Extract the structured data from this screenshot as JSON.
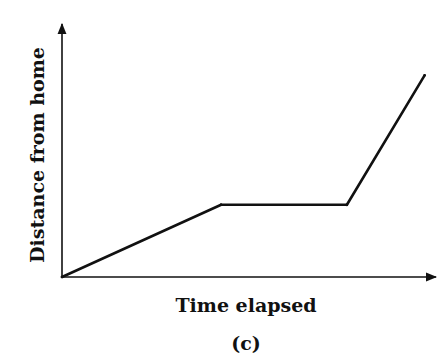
{
  "chart_data": {
    "type": "line",
    "title": "",
    "xlabel": "Time elapsed",
    "ylabel": "Distance from home",
    "caption": "(c)",
    "xlim": [
      0,
      1
    ],
    "ylim": [
      0,
      1
    ],
    "grid": false,
    "ticks": false,
    "series": [
      {
        "name": "distance",
        "x": [
          0,
          0.43,
          0.77,
          0.98
        ],
        "y": [
          0,
          0.29,
          0.29,
          0.81
        ]
      }
    ],
    "colors": {
      "line": "#111111",
      "axes": "#111111"
    }
  }
}
